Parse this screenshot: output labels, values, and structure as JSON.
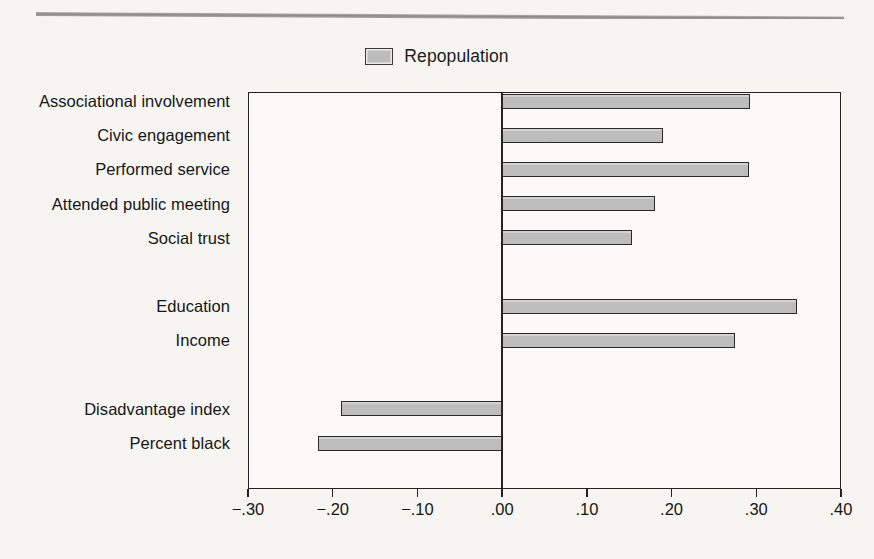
{
  "legend": {
    "swatch_name": "legend-swatch",
    "label": "Repopulation",
    "swatch_color": "#bdbdbd",
    "border_color": "#2a2a2a"
  },
  "chart_data": {
    "type": "bar",
    "orientation": "horizontal",
    "title": "",
    "xlabel": "",
    "ylabel": "",
    "xlim": [
      -0.3,
      0.4
    ],
    "xticks": [
      -0.3,
      -0.2,
      -0.1,
      0.0,
      0.1,
      0.2,
      0.3,
      0.4
    ],
    "xticklabels": [
      "−.30",
      "−.20",
      "−.10",
      ".00",
      ".10",
      ".20",
      ".30",
      ".40"
    ],
    "grid": false,
    "legend_position": "top-center",
    "zero_reference_line": 0.0,
    "series": [
      {
        "name": "Repopulation",
        "color": "#bdbdbd",
        "values": [
          0.293,
          0.19,
          0.291,
          0.18,
          0.153,
          null,
          0.348,
          0.275,
          null,
          -0.19,
          -0.217
        ]
      }
    ],
    "categories": [
      "Associational involvement",
      "Civic engagement",
      "Performed service",
      "Attended public meeting",
      "Social trust",
      "",
      "Education",
      "Income",
      "",
      "Disadvantage index",
      "Percent black"
    ],
    "groups": [
      {
        "name": "social-capital",
        "categories": [
          "Associational involvement",
          "Civic engagement",
          "Performed service",
          "Attended public meeting",
          "Social trust"
        ]
      },
      {
        "name": "socioeconomic-status",
        "categories": [
          "Education",
          "Income"
        ]
      },
      {
        "name": "disadvantage",
        "categories": [
          "Disadvantage index",
          "Percent black"
        ]
      }
    ]
  },
  "axis": {
    "tick_label_0": "−.30",
    "tick_label_1": "−.20",
    "tick_label_2": "−.10",
    "tick_label_3": ".00",
    "tick_label_4": ".10",
    "tick_label_5": ".20",
    "tick_label_6": ".30",
    "tick_label_7": ".40"
  },
  "labels": {
    "l0": "Associational involvement",
    "l1": "Civic engagement",
    "l2": "Performed service",
    "l3": "Attended public meeting",
    "l4": "Social trust",
    "l6": "Education",
    "l7": "Income",
    "l9": "Disadvantage index",
    "l10": "Percent black"
  }
}
